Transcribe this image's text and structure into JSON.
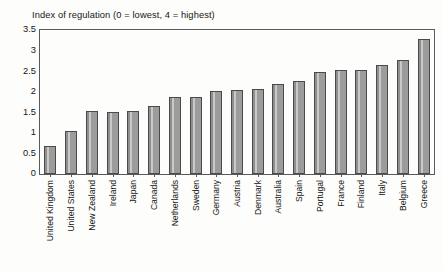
{
  "chart_data": {
    "type": "bar",
    "title": "Index of regulation (0 = lowest, 4 = highest)",
    "xlabel": "",
    "ylabel": "",
    "ylim": [
      0,
      3.5
    ],
    "yticks": [
      "0",
      "0.5",
      "1",
      "1.5",
      "2",
      "2.5",
      "3",
      "3.5"
    ],
    "ytick_values": [
      0,
      0.5,
      1,
      1.5,
      2,
      2.5,
      3,
      3.5
    ],
    "grid": false,
    "legend": false,
    "bar_color": "#9c9c9c",
    "bar_edge_color": "#4a4a4a",
    "categories": [
      "United Kingdom",
      "United States",
      "New Zealand",
      "Ireland",
      "Japan",
      "Canada",
      "Netherlands",
      "Sweden",
      "Germany",
      "Austria",
      "Denmark",
      "Australia",
      "Spain",
      "Portugal",
      "France",
      "Finland",
      "Italy",
      "Belgium",
      "Greece"
    ],
    "values": [
      0.67,
      1.05,
      1.52,
      1.51,
      1.54,
      1.65,
      1.86,
      1.88,
      2.02,
      2.05,
      2.07,
      2.2,
      2.26,
      2.48,
      2.52,
      2.53,
      2.66,
      2.78,
      3.27
    ]
  }
}
